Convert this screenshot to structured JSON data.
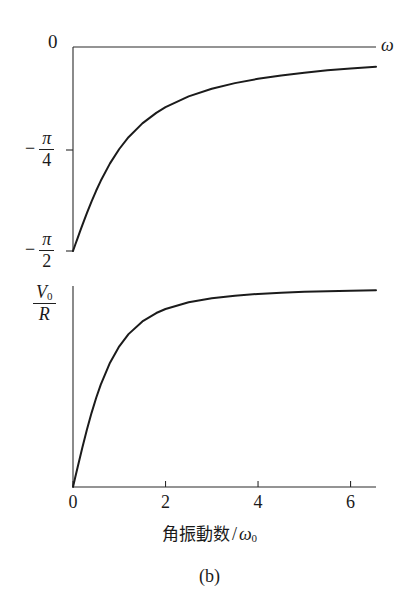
{
  "figure": {
    "caption": "(b)",
    "x_axis": {
      "title_text": "角振動数",
      "title_separator": "/",
      "title_variable": "ω",
      "title_variable_sub": "0",
      "ticks": [
        "0",
        "2",
        "4",
        "6"
      ],
      "tick_values": [
        0,
        2,
        4,
        6
      ],
      "range": [
        0,
        6.55
      ]
    },
    "top_panel": {
      "y_top_label": "0",
      "y_mid_minus": "−",
      "y_mid_num": "π",
      "y_mid_den": "4",
      "y_bot_minus": "−",
      "y_bot_num": "π",
      "y_bot_den": "2",
      "axis_arrow_label": "ω"
    },
    "bottom_panel": {
      "y_top_num": "V",
      "y_top_num_sub": "0",
      "y_top_den": "R"
    }
  },
  "chart_data": [
    {
      "type": "line",
      "title": "Phase vs angular frequency",
      "xlabel": "角振動数 / ω0",
      "ylabel": "phase",
      "xlim": [
        0,
        6.55
      ],
      "ylim": [
        -1.5708,
        0
      ],
      "ytick_labels": [
        "0",
        "−π/4",
        "−π/2"
      ],
      "ytick_values": [
        0,
        -0.7854,
        -1.5708
      ],
      "xtick_labels": [
        "0",
        "2",
        "4",
        "6"
      ],
      "xtick_values": [
        0,
        2,
        4,
        6
      ],
      "grid": false,
      "legend": "none",
      "series": [
        {
          "name": "phase = -arctan(ω0/ω)",
          "x": [
            0.0,
            0.05,
            0.1,
            0.15,
            0.2,
            0.3,
            0.4,
            0.5,
            0.6,
            0.8,
            1.0,
            1.2,
            1.5,
            1.8,
            2.0,
            2.5,
            3.0,
            3.5,
            4.0,
            4.5,
            5.0,
            5.5,
            6.0,
            6.55
          ],
          "y": [
            -1.5708,
            -1.5208,
            -1.4711,
            -1.4217,
            -1.3734,
            -1.2793,
            -1.1903,
            -1.1071,
            -1.0304,
            -0.8961,
            -0.7854,
            -0.6947,
            -0.588,
            -0.5071,
            -0.4636,
            -0.3805,
            -0.3217,
            -0.2783,
            -0.245,
            -0.2187,
            -0.1974,
            -0.1799,
            -0.1651,
            -0.1514
          ]
        }
      ]
    },
    {
      "type": "line",
      "title": "Amplitude vs angular frequency",
      "xlabel": "角振動数 / ω0",
      "ylabel": "V0/R",
      "xlim": [
        0,
        6.55
      ],
      "ylim": [
        0,
        1.02
      ],
      "ytick_labels": [
        "V0/R"
      ],
      "ytick_values": [
        1.0
      ],
      "xtick_labels": [
        "0",
        "2",
        "4",
        "6"
      ],
      "xtick_values": [
        0,
        2,
        4,
        6
      ],
      "grid": false,
      "legend": "none",
      "series": [
        {
          "name": "amplitude = (ω/ω0)/sqrt(1+(ω/ω0)^2)",
          "x": [
            0.0,
            0.05,
            0.1,
            0.2,
            0.3,
            0.4,
            0.5,
            0.6,
            0.8,
            1.0,
            1.2,
            1.5,
            1.8,
            2.0,
            2.5,
            3.0,
            3.5,
            4.0,
            4.5,
            5.0,
            5.5,
            6.0,
            6.55
          ],
          "y": [
            0.0,
            0.0499,
            0.0995,
            0.1961,
            0.2873,
            0.3714,
            0.4472,
            0.5145,
            0.6247,
            0.7071,
            0.7682,
            0.8321,
            0.8742,
            0.8944,
            0.9285,
            0.9487,
            0.9615,
            0.9701,
            0.9762,
            0.9806,
            0.9839,
            0.9864,
            0.9886
          ]
        }
      ]
    }
  ],
  "colors": {
    "curve": "#1b1b1b",
    "axis": "#2b2b2b",
    "text": "#1a1a1a",
    "background": "#ffffff"
  }
}
